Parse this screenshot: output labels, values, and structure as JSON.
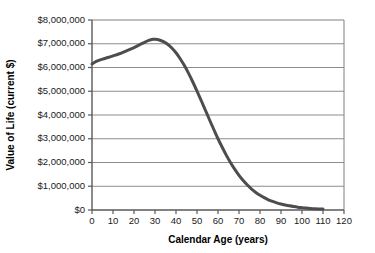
{
  "chart_data": {
    "type": "line",
    "title": "",
    "xlabel": "Calendar Age (years)",
    "ylabel": "Value of Life (current $)",
    "xlim": [
      0,
      120
    ],
    "ylim": [
      0,
      8000000
    ],
    "grid": "horizontal",
    "legend": "none",
    "line_color": "#4d4d4d",
    "line_width": 3,
    "x_ticks": [
      0,
      10,
      20,
      30,
      40,
      50,
      60,
      70,
      80,
      90,
      100,
      110,
      120
    ],
    "x_tick_labels": [
      "0",
      "10",
      "20",
      "30",
      "40",
      "50",
      "60",
      "70",
      "80",
      "90",
      "100",
      "110",
      "120"
    ],
    "y_ticks": [
      0,
      1000000,
      2000000,
      3000000,
      4000000,
      5000000,
      6000000,
      7000000,
      8000000
    ],
    "y_tick_labels": [
      "$0",
      "$1,000,000",
      "$2,000,000",
      "$3,000,000",
      "$4,000,000",
      "$5,000,000",
      "$6,000,000",
      "$7,000,000",
      "$8,000,000"
    ],
    "series": [
      {
        "name": "Value of Life",
        "x": [
          0,
          2,
          5,
          8,
          10,
          13,
          15,
          18,
          20,
          23,
          25,
          27,
          29,
          30,
          32,
          34,
          36,
          38,
          40,
          42,
          44,
          46,
          48,
          50,
          52,
          54,
          56,
          58,
          60,
          62,
          64,
          66,
          68,
          70,
          72,
          74,
          76,
          78,
          80,
          82,
          84,
          86,
          88,
          90,
          92,
          94,
          96,
          98,
          100,
          102,
          104,
          106,
          108,
          110
        ],
        "y": [
          6150000,
          6260000,
          6350000,
          6430000,
          6490000,
          6580000,
          6650000,
          6760000,
          6840000,
          6970000,
          7060000,
          7140000,
          7190000,
          7190000,
          7160000,
          7090000,
          6980000,
          6820000,
          6620000,
          6370000,
          6080000,
          5750000,
          5390000,
          5010000,
          4610000,
          4200000,
          3790000,
          3390000,
          3000000,
          2640000,
          2300000,
          1990000,
          1710000,
          1460000,
          1240000,
          1050000,
          880000,
          740000,
          620000,
          520000,
          430000,
          360000,
          300000,
          250000,
          210000,
          175000,
          145000,
          120000,
          100000,
          82000,
          68000,
          56000,
          46000,
          38000
        ]
      }
    ]
  }
}
